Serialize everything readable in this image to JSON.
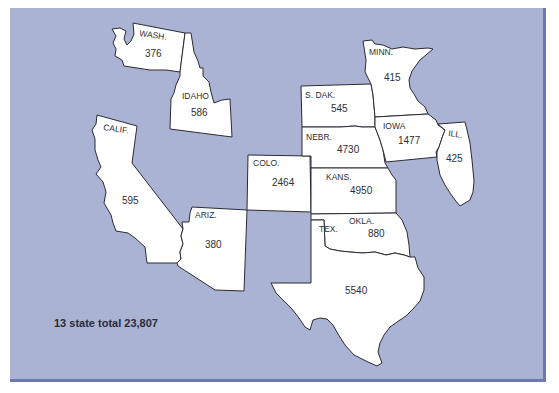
{
  "map": {
    "background_color": "#aab3d3",
    "border_color": "#6c78b2",
    "state_fill": "#ffffff",
    "states": [
      {
        "name": "WASH.",
        "value": "376"
      },
      {
        "name": "IDAHO",
        "value": "586"
      },
      {
        "name": "CALIF.",
        "value": "595"
      },
      {
        "name": "ARIZ.",
        "value": "380"
      },
      {
        "name": "COLO.",
        "value": "2464"
      },
      {
        "name": "S. DAK.",
        "value": "545"
      },
      {
        "name": "NEBR.",
        "value": "4730"
      },
      {
        "name": "KANS.",
        "value": "4950"
      },
      {
        "name": "MINN.",
        "value": "415"
      },
      {
        "name": "IOWA",
        "value": "1477"
      },
      {
        "name": "ILL.",
        "value": "425"
      },
      {
        "name": "OKLA.",
        "value": "880"
      },
      {
        "name": "TEX.",
        "value": "5540"
      }
    ],
    "total_label": "13 state total 23,807"
  }
}
